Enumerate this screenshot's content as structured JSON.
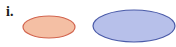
{
  "label": "i.",
  "shapes": [
    {
      "name": "small-ellipse",
      "cx": 49,
      "cy": 27,
      "rx": 26,
      "ry": 11,
      "fill": "#f4bfa4",
      "stroke": "#d2654f"
    },
    {
      "name": "large-ellipse",
      "cx": 134,
      "cy": 26,
      "rx": 41,
      "ry": 16,
      "fill": "#b7c0ea",
      "stroke": "#4a5aa8"
    }
  ]
}
